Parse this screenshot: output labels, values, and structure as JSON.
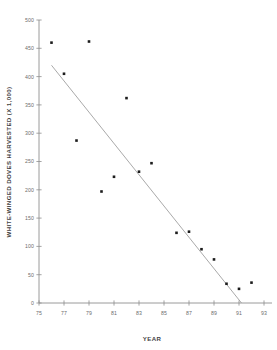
{
  "chart_data": {
    "type": "scatter",
    "title": "",
    "xlabel": "YEAR",
    "ylabel": "WHITE-WINGED DOVES HARVESTED (X 1,000)",
    "xlim": [
      75,
      93
    ],
    "ylim": [
      0,
      500
    ],
    "x_ticks": [
      "75",
      "77",
      "79",
      "81",
      "83",
      "85",
      "87",
      "89",
      "91",
      "93"
    ],
    "x_tick_values": [
      75,
      77,
      79,
      81,
      83,
      85,
      87,
      89,
      91,
      93
    ],
    "y_ticks": [
      "0",
      "50",
      "100",
      "150",
      "200",
      "250",
      "300",
      "350",
      "400",
      "450",
      "500"
    ],
    "y_tick_values": [
      0,
      50,
      100,
      150,
      200,
      250,
      300,
      350,
      400,
      450,
      500
    ],
    "grid": false,
    "legend": false,
    "legend_position": "none",
    "marker": "square",
    "marker_color": "#1c1c1c",
    "points": [
      {
        "x": 76,
        "y": 460
      },
      {
        "x": 77,
        "y": 405
      },
      {
        "x": 78,
        "y": 287
      },
      {
        "x": 79,
        "y": 462
      },
      {
        "x": 80,
        "y": 197
      },
      {
        "x": 81,
        "y": 223
      },
      {
        "x": 82,
        "y": 362
      },
      {
        "x": 83,
        "y": 232
      },
      {
        "x": 84,
        "y": 247
      },
      {
        "x": 86,
        "y": 124
      },
      {
        "x": 87,
        "y": 126
      },
      {
        "x": 88,
        "y": 95
      },
      {
        "x": 89,
        "y": 77
      },
      {
        "x": 90,
        "y": 34
      },
      {
        "x": 91,
        "y": 25
      },
      {
        "x": 92,
        "y": 36
      }
    ],
    "series": [
      {
        "name": "White-winged doves harvested",
        "x": [
          76,
          77,
          78,
          79,
          80,
          81,
          82,
          83,
          84,
          86,
          87,
          88,
          89,
          90,
          91,
          92
        ],
        "values": [
          460,
          405,
          287,
          462,
          197,
          223,
          362,
          232,
          247,
          124,
          126,
          95,
          77,
          34,
          25,
          36
        ]
      }
    ],
    "trend_line": {
      "name": "linear regression fit",
      "color": "#9a9a9a",
      "x_start": 76.0,
      "y_start": 420,
      "x_end": 91.2,
      "y_end": 0
    }
  }
}
